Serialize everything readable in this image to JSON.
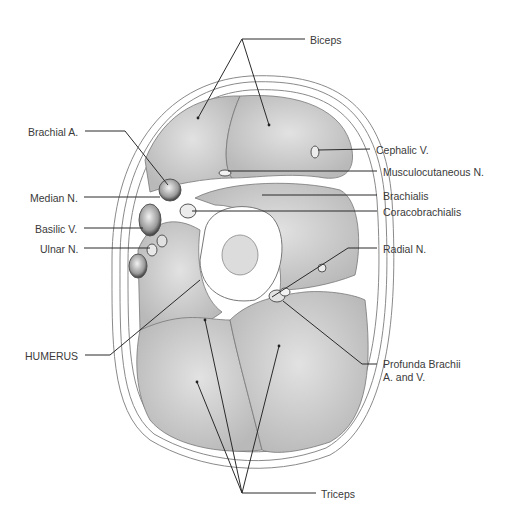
{
  "figure": {
    "colors": {
      "background": "#ffffff",
      "leader": "#2a2a2a",
      "text": "#3a3a3a",
      "muscle": "#cfcfcf",
      "outline": "#8a8a8a"
    }
  },
  "labels": [
    {
      "id": "biceps",
      "text": "Biceps",
      "x": 310,
      "y": 34
    },
    {
      "id": "brachial-a",
      "text": "Brachial A.",
      "x": 28,
      "y": 126
    },
    {
      "id": "cephalic-v",
      "text": "Cephalic V.",
      "x": 376,
      "y": 145
    },
    {
      "id": "musculocutaneous-n",
      "text": "Musculocutaneous N.",
      "x": 383,
      "y": 166
    },
    {
      "id": "median-n",
      "text": "Median N.",
      "x": 30,
      "y": 192
    },
    {
      "id": "brachialis",
      "text": "Brachialis",
      "x": 383,
      "y": 190
    },
    {
      "id": "coracobrachialis",
      "text": "Coracobrachialis",
      "x": 383,
      "y": 206
    },
    {
      "id": "basilic-v",
      "text": "Basilic V.",
      "x": 35,
      "y": 223
    },
    {
      "id": "ulnar-n",
      "text": "Ulnar N.",
      "x": 40,
      "y": 243
    },
    {
      "id": "radial-n",
      "text": "Radial N.",
      "x": 383,
      "y": 244
    },
    {
      "id": "humerus",
      "text": "HUMERUS",
      "x": 25,
      "y": 350
    },
    {
      "id": "profunda-brachii-1",
      "text": "Profunda Brachii",
      "x": 383,
      "y": 359
    },
    {
      "id": "profunda-brachii-2",
      "text": "A. and V.",
      "x": 383,
      "y": 372
    },
    {
      "id": "triceps",
      "text": "Triceps",
      "x": 321,
      "y": 488
    }
  ]
}
